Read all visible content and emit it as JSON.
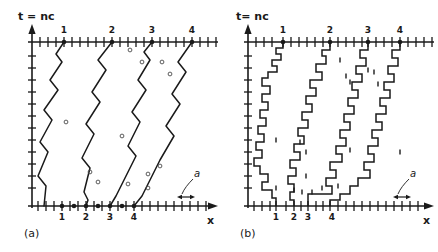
{
  "figure": {
    "background": "#ffffff",
    "ink": "#1a1a1a",
    "width": 438,
    "height": 252
  },
  "panels": [
    {
      "id": "a",
      "label": "(a)",
      "axis_y_label": "t = nc",
      "axis_x_label": "x",
      "lattice_label": "a",
      "tick_numbers": [
        "1",
        "2",
        "3",
        "4"
      ],
      "top_tick_numbers": [
        "1",
        "2",
        "3",
        "4"
      ]
    },
    {
      "id": "b",
      "label": "(b)",
      "axis_y_label": "t= nc",
      "axis_x_label": "x",
      "lattice_label": "a",
      "tick_numbers": [
        "1",
        "2",
        "3",
        "4"
      ],
      "top_tick_numbers": [
        "1",
        "2",
        "3",
        "4"
      ]
    }
  ],
  "chart_data": {
    "type": "line",
    "title": "",
    "xlabel": "x",
    "ylabel": "t = nc",
    "grid": false,
    "legend": null,
    "axis": {
      "x_tick_spacing_px": 8,
      "x_ticks_count": 23,
      "y_ticks_count": 13,
      "top_axis": true,
      "bottom_axis": true
    },
    "panel_a": {
      "start_x_top": [
        64,
        112,
        152,
        192
      ],
      "end_x_bottom": [
        62,
        86,
        110,
        134
      ],
      "marked_bottom_dots": [
        62,
        74,
        86,
        98,
        110,
        122,
        134
      ],
      "bottom_labels_x": [
        62,
        86,
        110,
        134
      ],
      "defect_circles": [
        [
          130,
          50
        ],
        [
          142,
          62
        ],
        [
          162,
          62
        ],
        [
          170,
          74
        ],
        [
          66,
          122
        ],
        [
          122,
          136
        ],
        [
          90,
          172
        ],
        [
          98,
          182
        ],
        [
          128,
          184
        ],
        [
          148,
          174
        ],
        [
          148,
          188
        ],
        [
          160,
          166
        ]
      ],
      "trajectories": [
        [
          [
            64,
            42
          ],
          [
            56,
            54
          ],
          [
            62,
            62
          ],
          [
            50,
            80
          ],
          [
            58,
            90
          ],
          [
            44,
            110
          ],
          [
            52,
            120
          ],
          [
            40,
            142
          ],
          [
            48,
            152
          ],
          [
            38,
            176
          ],
          [
            46,
            186
          ],
          [
            44,
            206
          ]
        ],
        [
          [
            112,
            42
          ],
          [
            98,
            60
          ],
          [
            106,
            70
          ],
          [
            92,
            92
          ],
          [
            100,
            102
          ],
          [
            86,
            124
          ],
          [
            94,
            134
          ],
          [
            82,
            158
          ],
          [
            90,
            168
          ],
          [
            84,
            192
          ],
          [
            88,
            200
          ],
          [
            86,
            206
          ]
        ],
        [
          [
            152,
            42
          ],
          [
            144,
            52
          ],
          [
            150,
            60
          ],
          [
            138,
            80
          ],
          [
            146,
            90
          ],
          [
            132,
            112
          ],
          [
            140,
            122
          ],
          [
            128,
            146
          ],
          [
            136,
            156
          ],
          [
            124,
            180
          ],
          [
            116,
            196
          ],
          [
            110,
            206
          ]
        ],
        [
          [
            192,
            42
          ],
          [
            178,
            62
          ],
          [
            186,
            72
          ],
          [
            172,
            94
          ],
          [
            180,
            104
          ],
          [
            166,
            126
          ],
          [
            174,
            136
          ],
          [
            160,
            160
          ],
          [
            150,
            180
          ],
          [
            142,
            196
          ],
          [
            134,
            206
          ]
        ]
      ]
    },
    "panel_b": {
      "start_x_top": [
        283,
        330,
        368,
        400
      ],
      "end_x_bottom": [
        276,
        294,
        308,
        330
      ],
      "bottom_labels_x": [
        276,
        294,
        308,
        330
      ],
      "trajectories": [
        [
          [
            283,
            42
          ],
          [
            283,
            48
          ],
          [
            276,
            48
          ],
          [
            276,
            54
          ],
          [
            281,
            54
          ],
          [
            281,
            60
          ],
          [
            272,
            60
          ],
          [
            272,
            66
          ],
          [
            277,
            66
          ],
          [
            277,
            72
          ],
          [
            268,
            72
          ],
          [
            268,
            78
          ],
          [
            262,
            78
          ],
          [
            262,
            86
          ],
          [
            270,
            86
          ],
          [
            270,
            94
          ],
          [
            262,
            94
          ],
          [
            262,
            102
          ],
          [
            268,
            102
          ],
          [
            268,
            110
          ],
          [
            260,
            110
          ],
          [
            260,
            118
          ],
          [
            266,
            118
          ],
          [
            266,
            126
          ],
          [
            258,
            126
          ],
          [
            258,
            134
          ],
          [
            264,
            134
          ],
          [
            264,
            142
          ],
          [
            256,
            142
          ],
          [
            256,
            150
          ],
          [
            262,
            150
          ],
          [
            262,
            158
          ],
          [
            254,
            158
          ],
          [
            254,
            166
          ],
          [
            260,
            166
          ],
          [
            260,
            174
          ],
          [
            268,
            174
          ],
          [
            268,
            182
          ],
          [
            262,
            182
          ],
          [
            262,
            190
          ],
          [
            272,
            190
          ],
          [
            272,
            198
          ],
          [
            276,
            198
          ],
          [
            276,
            206
          ]
        ],
        [
          [
            330,
            42
          ],
          [
            330,
            50
          ],
          [
            322,
            50
          ],
          [
            322,
            56
          ],
          [
            326,
            56
          ],
          [
            326,
            64
          ],
          [
            316,
            64
          ],
          [
            316,
            72
          ],
          [
            322,
            72
          ],
          [
            322,
            80
          ],
          [
            310,
            80
          ],
          [
            310,
            88
          ],
          [
            316,
            88
          ],
          [
            316,
            96
          ],
          [
            306,
            96
          ],
          [
            306,
            104
          ],
          [
            312,
            104
          ],
          [
            312,
            112
          ],
          [
            302,
            112
          ],
          [
            302,
            120
          ],
          [
            308,
            120
          ],
          [
            308,
            128
          ],
          [
            298,
            128
          ],
          [
            298,
            136
          ],
          [
            304,
            136
          ],
          [
            304,
            144
          ],
          [
            294,
            144
          ],
          [
            294,
            152
          ],
          [
            300,
            152
          ],
          [
            300,
            160
          ],
          [
            290,
            160
          ],
          [
            290,
            168
          ],
          [
            296,
            168
          ],
          [
            296,
            176
          ],
          [
            288,
            176
          ],
          [
            288,
            184
          ],
          [
            294,
            184
          ],
          [
            294,
            192
          ],
          [
            290,
            192
          ],
          [
            290,
            200
          ],
          [
            294,
            200
          ],
          [
            294,
            206
          ]
        ],
        [
          [
            368,
            42
          ],
          [
            368,
            50
          ],
          [
            360,
            50
          ],
          [
            360,
            58
          ],
          [
            366,
            58
          ],
          [
            366,
            66
          ],
          [
            356,
            66
          ],
          [
            356,
            74
          ],
          [
            362,
            74
          ],
          [
            362,
            82
          ],
          [
            352,
            82
          ],
          [
            352,
            90
          ],
          [
            358,
            90
          ],
          [
            358,
            98
          ],
          [
            348,
            98
          ],
          [
            348,
            106
          ],
          [
            354,
            106
          ],
          [
            354,
            114
          ],
          [
            344,
            114
          ],
          [
            344,
            122
          ],
          [
            350,
            122
          ],
          [
            350,
            130
          ],
          [
            340,
            130
          ],
          [
            340,
            138
          ],
          [
            346,
            138
          ],
          [
            346,
            146
          ],
          [
            336,
            146
          ],
          [
            336,
            154
          ],
          [
            342,
            154
          ],
          [
            342,
            162
          ],
          [
            330,
            162
          ],
          [
            330,
            170
          ],
          [
            336,
            170
          ],
          [
            336,
            178
          ],
          [
            326,
            178
          ],
          [
            326,
            186
          ],
          [
            332,
            186
          ],
          [
            332,
            194
          ],
          [
            308,
            194
          ],
          [
            308,
            206
          ]
        ],
        [
          [
            400,
            42
          ],
          [
            400,
            50
          ],
          [
            392,
            50
          ],
          [
            392,
            58
          ],
          [
            398,
            58
          ],
          [
            398,
            66
          ],
          [
            388,
            66
          ],
          [
            388,
            74
          ],
          [
            394,
            74
          ],
          [
            394,
            82
          ],
          [
            384,
            82
          ],
          [
            384,
            90
          ],
          [
            390,
            90
          ],
          [
            390,
            98
          ],
          [
            380,
            98
          ],
          [
            380,
            106
          ],
          [
            386,
            106
          ],
          [
            386,
            114
          ],
          [
            376,
            114
          ],
          [
            376,
            122
          ],
          [
            382,
            122
          ],
          [
            382,
            130
          ],
          [
            372,
            130
          ],
          [
            372,
            138
          ],
          [
            378,
            138
          ],
          [
            378,
            146
          ],
          [
            368,
            146
          ],
          [
            368,
            154
          ],
          [
            374,
            154
          ],
          [
            374,
            162
          ],
          [
            364,
            162
          ],
          [
            364,
            170
          ],
          [
            370,
            170
          ],
          [
            370,
            178
          ],
          [
            358,
            178
          ],
          [
            358,
            186
          ],
          [
            350,
            186
          ],
          [
            350,
            194
          ],
          [
            340,
            194
          ],
          [
            340,
            200
          ],
          [
            330,
            200
          ],
          [
            330,
            206
          ]
        ]
      ],
      "defect_marks": [
        [
          340,
          60
        ],
        [
          368,
          70
        ],
        [
          374,
          72
        ],
        [
          346,
          76
        ],
        [
          378,
          84
        ],
        [
          350,
          82
        ],
        [
          276,
          140
        ],
        [
          300,
          142
        ],
        [
          306,
          152
        ],
        [
          350,
          150
        ],
        [
          400,
          152
        ],
        [
          306,
          176
        ],
        [
          276,
          188
        ],
        [
          294,
          190
        ],
        [
          302,
          192
        ],
        [
          312,
          192
        ],
        [
          322,
          188
        ],
        [
          338,
          186
        ]
      ]
    }
  }
}
